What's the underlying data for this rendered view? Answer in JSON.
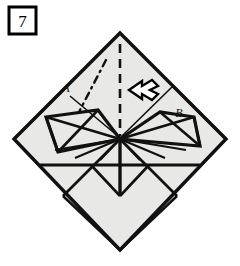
{
  "figure": {
    "kind": "origami-fold-diagram",
    "step_number": "7",
    "canvas": {
      "width": 240,
      "height": 266
    },
    "paper_fill": "#e8e8e6",
    "line_color": "#111111",
    "background": "#ffffff"
  },
  "step_box": {
    "label": "7",
    "x": 8,
    "y": 6,
    "width": 28,
    "height": 28,
    "border_color": "#000000"
  },
  "labels": [
    {
      "name": "label-a",
      "text": "A",
      "x": 66,
      "y": 92
    },
    {
      "name": "label-b",
      "text": "B",
      "x": 179,
      "y": 116
    }
  ],
  "shape": {
    "name": "paper-diamond",
    "vertices": {
      "top": {
        "x": 120,
        "y": 33
      },
      "left": {
        "x": 14,
        "y": 139
      },
      "bottom": {
        "x": 120,
        "y": 250
      },
      "right": {
        "x": 226,
        "y": 139
      },
      "center": {
        "x": 120,
        "y": 139
      }
    }
  },
  "creases": {
    "valley_dashed_vertical": {
      "name": "center-fold-line",
      "style": "dashed",
      "from": {
        "x": 120,
        "y": 44
      },
      "to": {
        "x": 120,
        "y": 136
      }
    },
    "dash_dot_left": {
      "name": "reference-dash-dot-line",
      "style": "dash-dot",
      "from": {
        "x": 104,
        "y": 62
      },
      "to": {
        "x": 79,
        "y": 110
      }
    }
  },
  "arrow": {
    "name": "fold-direction-arrow",
    "direction": "left",
    "tip": {
      "x": 129,
      "y": 90
    },
    "tail": {
      "x": 158,
      "y": 90
    },
    "fill": "#ffffff",
    "stroke": "#000000"
  },
  "annotations": {
    "description": "Origami step 7: a square sheet rotated 45 degrees with pre-creased flaps meeting at the centre; a dashed centre line and a hollow arrow indicate folding the right flap B across to the left toward flap A."
  }
}
